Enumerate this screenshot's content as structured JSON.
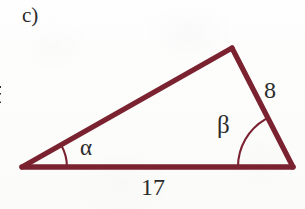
{
  "figure": {
    "part_label": "c)",
    "line_color": "#7a2230",
    "text_color": "#2b2b2b",
    "background_color": "#fdfdfc"
  },
  "triangle": {
    "vertices": {
      "left": {
        "x": 22,
        "y": 167
      },
      "apex": {
        "x": 232,
        "y": 48
      },
      "right": {
        "x": 293,
        "y": 167
      }
    },
    "stroke_width": 5
  },
  "labels": {
    "side_base": "17",
    "side_right": "8",
    "side_left_clipped": "5",
    "angle_left": "α",
    "angle_right": "β"
  },
  "angle_marks": {
    "alpha": {
      "radius": 45,
      "center_x": 22,
      "center_y": 167
    },
    "beta": {
      "radius": 55,
      "center_x": 293,
      "center_y": 167
    }
  }
}
